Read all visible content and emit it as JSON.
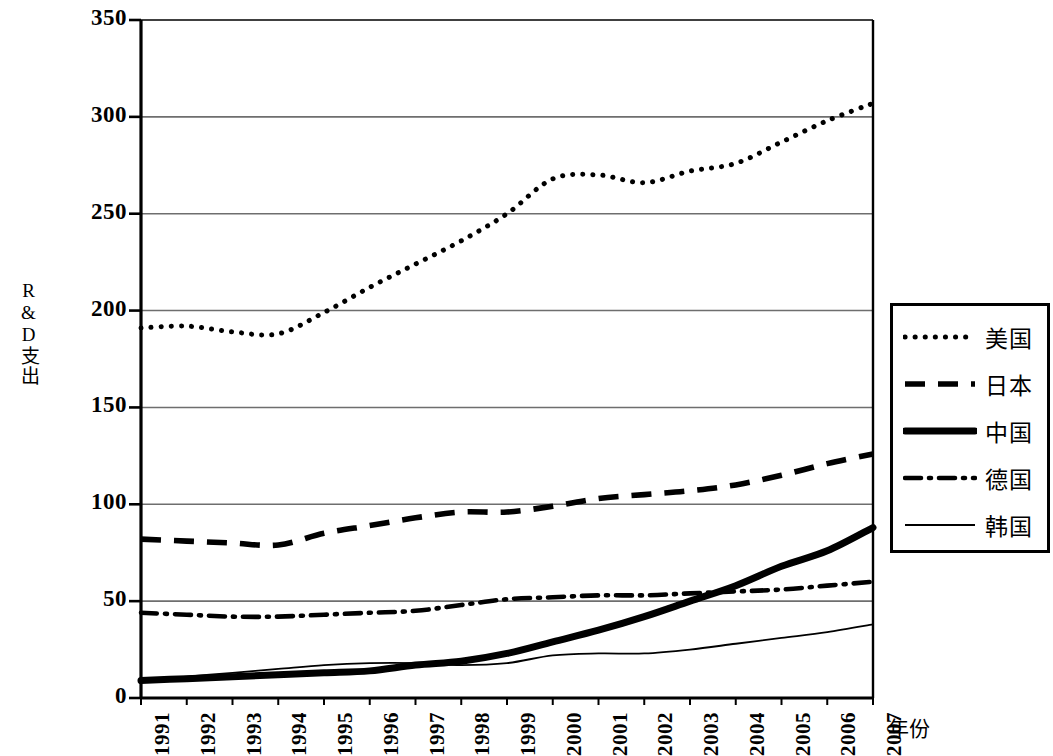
{
  "chart_data": {
    "type": "line",
    "title": "",
    "xlabel": "年份",
    "ylabel": "R&D支出",
    "x": [
      1991,
      1992,
      1993,
      1994,
      1995,
      1996,
      1997,
      1998,
      1999,
      2000,
      2001,
      2002,
      2003,
      2004,
      2005,
      2006,
      2007
    ],
    "categories": [
      "1991",
      "1992",
      "1993",
      "1994",
      "1995",
      "1996",
      "1997",
      "1998",
      "1999",
      "2000",
      "2001",
      "2002",
      "2003",
      "2004",
      "2005",
      "2006",
      "2007"
    ],
    "xlim": [
      1991,
      2007
    ],
    "ylim": [
      0,
      350
    ],
    "yticks": [
      0,
      50,
      100,
      150,
      200,
      250,
      300,
      350
    ],
    "ytick_labels": [
      "0",
      "50",
      "100",
      "150",
      "200",
      "250",
      "300",
      "350"
    ],
    "grid": true,
    "grid_axis": "y",
    "legend_position": "right",
    "series": [
      {
        "name": "美国",
        "style": "dotted",
        "values": [
          191,
          192,
          189,
          188,
          199,
          212,
          224,
          236,
          250,
          268,
          270,
          266,
          272,
          276,
          287,
          298,
          307
        ]
      },
      {
        "name": "日本",
        "style": "dashed",
        "values": [
          82,
          81,
          80,
          79,
          85,
          89,
          93,
          96,
          96,
          99,
          103,
          105,
          107,
          110,
          115,
          121,
          126
        ]
      },
      {
        "name": "中国",
        "style": "thick-solid",
        "values": [
          9,
          10,
          11,
          12,
          13,
          14,
          17,
          19,
          23,
          29,
          35,
          42,
          50,
          58,
          68,
          76,
          88
        ]
      },
      {
        "name": "德国",
        "style": "dash-dot",
        "values": [
          44,
          43,
          42,
          42,
          43,
          44,
          45,
          48,
          51,
          52,
          53,
          53,
          54,
          55,
          56,
          58,
          60
        ]
      },
      {
        "name": "韩国",
        "style": "thin-solid",
        "values": [
          9,
          11,
          13,
          15,
          17,
          18,
          18,
          17,
          18,
          22,
          23,
          23,
          25,
          28,
          31,
          34,
          38
        ]
      }
    ]
  },
  "axes": {
    "ylabel": "R&D支出",
    "xlabel": "年份",
    "ytick_labels": [
      "350",
      "300",
      "250",
      "200",
      "150",
      "100",
      "50",
      "0"
    ],
    "xtick_labels": [
      "1991",
      "1992",
      "1993",
      "1994",
      "1995",
      "1996",
      "1997",
      "1998",
      "1999",
      "2000",
      "2001",
      "2002",
      "2003",
      "2004",
      "2005",
      "2006",
      "2007"
    ]
  },
  "legend": {
    "items": [
      {
        "label": "美国",
        "style": "dotted"
      },
      {
        "label": "日本",
        "style": "dashed"
      },
      {
        "label": "中国",
        "style": "thick-solid"
      },
      {
        "label": "德国",
        "style": "dash-dot"
      },
      {
        "label": "韩国",
        "style": "thin-solid"
      }
    ]
  },
  "colors": {
    "line": "#000000",
    "grid": "#6e6e6e",
    "axis": "#000000",
    "background": "#ffffff"
  }
}
